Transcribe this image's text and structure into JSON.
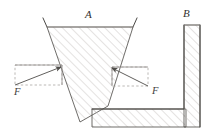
{
  "figure": {
    "type": "engineering-mechanics-diagram",
    "background_color": "#ffffff",
    "ink_color": "#4a4845",
    "hatch_color": "#c8c5c1",
    "dashed_color": "#a9a6a2",
    "labels": {
      "wedge": "A",
      "block": "B",
      "force_left": "F",
      "force_right": "F"
    },
    "geometry": {
      "wedge": {
        "name": "wedge-a",
        "points": "47,27 133,27 108,106 80,122",
        "top_left_x": 47,
        "top_right_x": 133,
        "top_y": 27,
        "apex_y": 122
      },
      "wedge_left_extension": {
        "name": "wedge-left-edge-extension",
        "from_x": 43,
        "from_y": 18,
        "to_x": 47,
        "to_y": 27
      },
      "wedge_right_extension": {
        "name": "wedge-right-edge-extension",
        "from_x": 137,
        "from_y": 18,
        "to_x": 133,
        "to_y": 27
      },
      "block_base": {
        "name": "block-b-base-slab",
        "points": "92,109 186,109 186,127 92,127"
      },
      "block_column": {
        "name": "block-b-vertical-column",
        "points": "184,25 200,25 200,127 184,127"
      },
      "left_force": {
        "rect": {
          "x": 15,
          "y": 65,
          "w": 47,
          "h": 20
        },
        "arrow_from_x": 15,
        "arrow_from_y": 85,
        "arrow_to_x": 63,
        "arrow_to_y": 66,
        "label_x": 14,
        "label_y": 95
      },
      "right_force": {
        "rect": {
          "x": 112,
          "y": 67,
          "w": 36,
          "h": 19
        },
        "arrow_from_x": 148,
        "arrow_from_y": 86,
        "arrow_to_x": 110,
        "arrow_to_y": 67,
        "label_x": 152,
        "label_y": 94
      }
    }
  }
}
